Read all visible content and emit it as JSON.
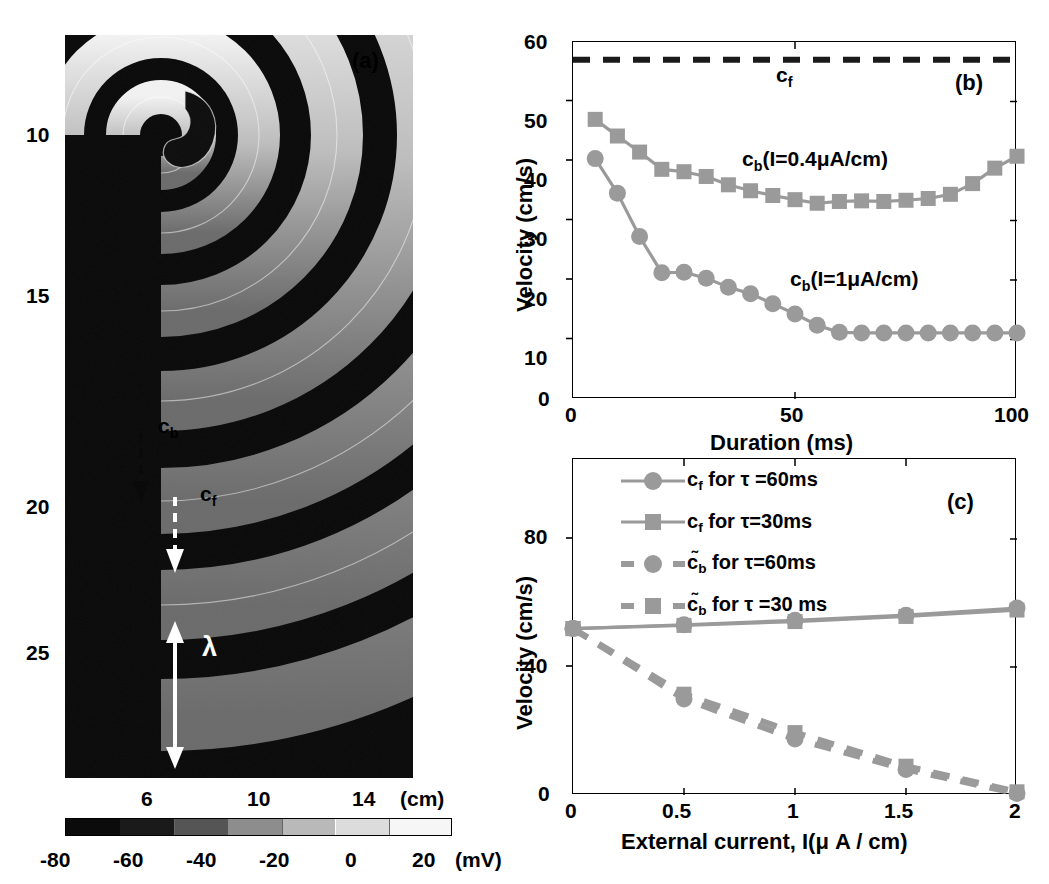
{
  "figure": {
    "panels": [
      "a",
      "b",
      "c"
    ],
    "panel_a_label": "(a)",
    "panel_b_label": "(b)",
    "panel_c_label": "(c)"
  },
  "panel_a": {
    "kind": "heatmap",
    "description": "spiral wave voltage map",
    "y_ticks": [
      "10",
      "15",
      "20",
      "25"
    ],
    "y_tick_values": [
      10,
      15,
      20,
      25
    ],
    "x_ticks": [
      "6",
      "10",
      "14"
    ],
    "x_tick_values": [
      6,
      10,
      14
    ],
    "x_unit_label": "(cm)",
    "annotations": {
      "cb": "c",
      "cb_sub": "b",
      "cf": "c",
      "cf_sub": "f",
      "lambda": "λ"
    },
    "colorbar": {
      "ticks": [
        "-80",
        "-60",
        "-40",
        "-20",
        "0",
        "20"
      ],
      "tick_values": [
        -80,
        -60,
        -40,
        -20,
        0,
        20
      ],
      "unit_label": "(mV)",
      "vmin": -90,
      "vmax": 30
    }
  },
  "panel_b": {
    "chart_data": {
      "type": "line",
      "title": "",
      "xlabel": "Duration (ms)",
      "ylabel": "Velocity (cm/s)",
      "xlim": [
        0,
        100
      ],
      "ylim": [
        0,
        60
      ],
      "xticks": [
        0,
        50,
        100
      ],
      "xtick_labels": [
        "0",
        "50",
        "100"
      ],
      "yticks": [
        0,
        10,
        20,
        30,
        40,
        50,
        60
      ],
      "ytick_labels": [
        "0",
        "10",
        "20",
        "30",
        "40",
        "50",
        "60"
      ],
      "grid": false,
      "legend": "inline-annotations",
      "series": [
        {
          "name": "c_f",
          "label_main": "c",
          "label_sub": "f",
          "style": "dashed",
          "color": "#1a1a1a",
          "marker": "none",
          "x": [
            0,
            100
          ],
          "values": [
            57,
            57
          ]
        },
        {
          "name": "c_b(I=0.4uA/cm)",
          "label_main": "c",
          "label_sub": "b",
          "label_rest": "(I=0.4μA/cm)",
          "style": "solid",
          "color": "#9a9a9a",
          "marker": "square",
          "x": [
            5,
            10,
            15,
            20,
            25,
            30,
            35,
            40,
            45,
            50,
            55,
            60,
            65,
            70,
            75,
            80,
            85,
            90,
            95,
            100
          ],
          "values": [
            47.0,
            44.2,
            41.5,
            38.6,
            38.2,
            37.4,
            36.0,
            35.0,
            34.2,
            33.5,
            32.9,
            33.2,
            33.3,
            33.2,
            33.4,
            33.7,
            34.4,
            36.2,
            38.8,
            40.8
          ]
        },
        {
          "name": "c_b(I=1uA/cm)",
          "label_main": "c",
          "label_sub": "b",
          "label_rest": "(I=1μA/cm)",
          "style": "solid",
          "color": "#9a9a9a",
          "marker": "circle",
          "x": [
            5,
            10,
            15,
            20,
            25,
            30,
            35,
            40,
            45,
            50,
            55,
            60,
            65,
            70,
            75,
            80,
            85,
            90,
            95,
            100
          ],
          "values": [
            40.4,
            34.6,
            27.3,
            21.2,
            21.3,
            20.3,
            18.8,
            17.7,
            16.0,
            14.3,
            12.4,
            11.2,
            11.1,
            11.1,
            11.1,
            11.1,
            11.1,
            11.1,
            11.1,
            11.1
          ]
        }
      ]
    }
  },
  "panel_c": {
    "chart_data": {
      "type": "line",
      "title": "",
      "xlabel": "External current, I(μ A / cm)",
      "ylabel": "Velocity (cm/s)",
      "xlim": [
        0,
        2
      ],
      "ylim": [
        0,
        105
      ],
      "xticks": [
        0,
        0.5,
        1,
        1.5,
        2
      ],
      "xtick_labels": [
        "0",
        "0.5",
        "1",
        "1.5",
        "2"
      ],
      "yticks": [
        0,
        40,
        80
      ],
      "ytick_labels": [
        "0",
        "40",
        "80"
      ],
      "grid": false,
      "legend_position": "upper-left",
      "series": [
        {
          "name": "cf-tau60",
          "legend": "c_f for τ =60ms",
          "legend_main": "c",
          "legend_sub": "f",
          "legend_rest": "for τ =60ms",
          "style": "solid",
          "color": "#9a9a9a",
          "marker": "circle",
          "x": [
            0,
            0.5,
            1,
            1.5,
            2
          ],
          "values": [
            52.0,
            53.2,
            54.6,
            56.2,
            58.4
          ]
        },
        {
          "name": "cf-tau30",
          "legend": "c_f for τ=30ms",
          "legend_main": "c",
          "legend_sub": "f",
          "legend_rest": "for τ=30ms",
          "style": "solid",
          "color": "#9a9a9a",
          "marker": "square",
          "x": [
            0,
            0.5,
            1,
            1.5,
            2
          ],
          "values": [
            52.0,
            53.0,
            54.2,
            55.8,
            57.8
          ]
        },
        {
          "name": "cb-tilde-tau60",
          "legend": "c̃_b for τ=60ms",
          "legend_main": "c̃",
          "legend_sub": "b",
          "legend_rest": "for τ=60ms",
          "style": "dashed",
          "color": "#9a9a9a",
          "marker": "circle",
          "x": [
            0,
            0.5,
            1,
            1.5,
            2
          ],
          "values": [
            52.0,
            30.0,
            17.5,
            8.0,
            0.5
          ]
        },
        {
          "name": "cb-tilde-tau30",
          "legend": "c̃_b for τ =30 ms",
          "legend_main": "c̃",
          "legend_sub": "b",
          "legend_rest": "for τ =30 ms",
          "style": "dashed",
          "color": "#9a9a9a",
          "marker": "square",
          "x": [
            0,
            0.5,
            1,
            1.5,
            2
          ],
          "values": [
            52.0,
            31.5,
            19.5,
            9.0,
            1.0
          ]
        }
      ]
    }
  }
}
